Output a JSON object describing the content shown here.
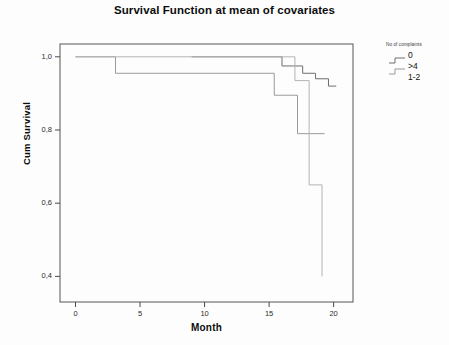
{
  "chart_data": {
    "type": "line",
    "title": "Survival Function at mean of covariates",
    "xlabel": "Month",
    "ylabel": "Cum Survival",
    "xlim": [
      -1.2,
      21.5
    ],
    "ylim": [
      0.33,
      1.035
    ],
    "xticks": [
      "0",
      "5",
      "10",
      "15",
      "20"
    ],
    "xtick_values": [
      0,
      5,
      10,
      15,
      20
    ],
    "yticks": [
      "1,0",
      "0,8",
      "0,6",
      "0,4"
    ],
    "ytick_values": [
      1.0,
      0.8,
      0.6,
      0.4
    ],
    "grid": false,
    "legend_position": "right",
    "legend_title": "No of complaints",
    "series": [
      {
        "name": "0",
        "color": "#6e6e6e",
        "x": [
          9.0,
          15.2,
          16.0,
          16.8,
          17.6,
          18.6,
          19.6,
          20.2
        ],
        "y": [
          1.0,
          1.0,
          0.975,
          0.975,
          0.955,
          0.94,
          0.92,
          0.92
        ]
      },
      {
        "name": ">4",
        "color": "#9a9a9a",
        "x": [
          0.0,
          3.1,
          13.9,
          15.4,
          16.4,
          17.2,
          19.3
        ],
        "y": [
          1.0,
          0.955,
          0.955,
          0.895,
          0.895,
          0.79,
          0.79
        ]
      },
      {
        "name": "1-2",
        "color": "#b4b4b4",
        "x": [
          0.0,
          16.0,
          17.0,
          18.1,
          19.1
        ],
        "y": [
          1.0,
          1.0,
          0.935,
          0.65,
          0.4
        ]
      }
    ],
    "legend_entries": [
      {
        "label": "0",
        "has_step_glyph": true
      },
      {
        "label": ">4",
        "has_step_glyph": true
      },
      {
        "label": "1-2",
        "has_step_glyph": false
      }
    ]
  },
  "colors": {
    "axis": "#4a4a4a",
    "plot_background": "#fdfdfd",
    "text": "#111111"
  }
}
